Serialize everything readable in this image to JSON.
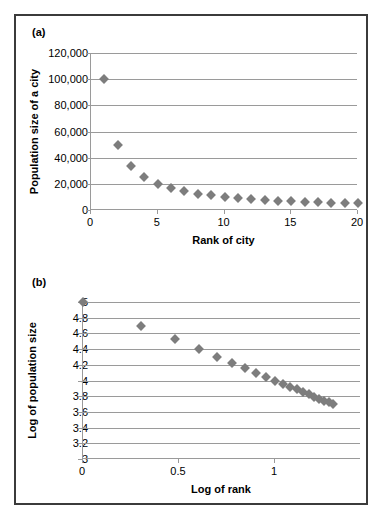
{
  "figure": {
    "panel_a_label": "(a)",
    "panel_b_label": "(b)"
  },
  "chart_data": [
    {
      "id": "panel-a",
      "type": "scatter",
      "title": "",
      "xlabel": "Rank of city",
      "ylabel": "Population size of a city",
      "xlim": [
        0,
        20
      ],
      "ylim": [
        0,
        120000
      ],
      "grid": true,
      "legend": null,
      "xticks": [
        0,
        5,
        10,
        15,
        20
      ],
      "xticklabels": [
        "0",
        "5",
        "10",
        "15",
        "20"
      ],
      "yticks": [
        0,
        20000,
        40000,
        60000,
        80000,
        100000,
        120000
      ],
      "yticklabels": [
        "0",
        "20,000",
        "40,000",
        "60,000",
        "80,000",
        "100,000",
        "120,000"
      ],
      "marker": "diamond",
      "marker_color": "#7d7d7d",
      "x": [
        1,
        2,
        3,
        4,
        5,
        6,
        7,
        8,
        9,
        10,
        11,
        12,
        13,
        14,
        15,
        16,
        17,
        18,
        19,
        20
      ],
      "y": [
        100000,
        50000,
        33333,
        25000,
        20000,
        16667,
        14286,
        12500,
        11111,
        10000,
        9091,
        8333,
        7692,
        7143,
        6667,
        6250,
        5882,
        5556,
        5263,
        5000
      ]
    },
    {
      "id": "panel-b",
      "type": "scatter",
      "title": "",
      "xlabel": "Log of rank",
      "ylabel": "Log of population size",
      "xlim": [
        0,
        1.448
      ],
      "ylim": [
        3,
        5
      ],
      "grid": true,
      "legend": null,
      "xticks": [
        0,
        0.5,
        1
      ],
      "xticklabels": [
        "0",
        "0.5",
        "1"
      ],
      "yticks": [
        3,
        3.2,
        3.4,
        3.6,
        3.8,
        4,
        4.2,
        4.4,
        4.6,
        4.8,
        5
      ],
      "yticklabels": [
        "3",
        "3.2",
        "3.4",
        "3.6",
        "3.8",
        "4",
        "4.2",
        "4.4",
        "4.6",
        "4.8",
        "5"
      ],
      "marker": "diamond",
      "marker_color": "#7d7d7d",
      "x": [
        0,
        0.301,
        0.477,
        0.602,
        0.699,
        0.778,
        0.845,
        0.903,
        0.954,
        1.0,
        1.041,
        1.079,
        1.114,
        1.146,
        1.176,
        1.204,
        1.23,
        1.255,
        1.279,
        1.301
      ],
      "y": [
        5.0,
        4.699,
        4.523,
        4.398,
        4.301,
        4.222,
        4.155,
        4.097,
        4.046,
        4.0,
        3.959,
        3.921,
        3.886,
        3.854,
        3.824,
        3.796,
        3.77,
        3.745,
        3.721,
        3.699
      ]
    }
  ]
}
